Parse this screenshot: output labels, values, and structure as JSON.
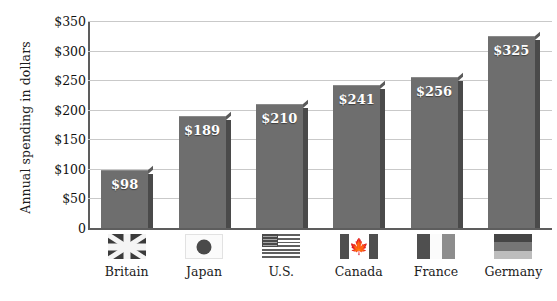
{
  "chart_data": {
    "type": "bar",
    "title": "",
    "xlabel": "",
    "ylabel": "Annual spending in dollars",
    "categories": [
      "Britain",
      "Japan",
      "U.S.",
      "Canada",
      "France",
      "Germany"
    ],
    "values": [
      98,
      189,
      210,
      241,
      256,
      325
    ],
    "value_labels": [
      "$98",
      "$189",
      "$210",
      "$241",
      "$256",
      "$325"
    ],
    "ylim": [
      0,
      350
    ],
    "ytick_values": [
      0,
      50,
      100,
      150,
      200,
      250,
      300,
      350
    ],
    "ytick_labels": [
      "0",
      "$50",
      "$100",
      "$150",
      "$200",
      "$250",
      "$300",
      "$350"
    ],
    "grid": true,
    "legend": "none",
    "series": [
      {
        "name": "Annual spending",
        "values": [
          98,
          189,
          210,
          241,
          256,
          325
        ]
      }
    ],
    "category_icons": [
      "flag-britain-icon",
      "flag-japan-icon",
      "flag-us-icon",
      "flag-canada-icon",
      "flag-france-icon",
      "flag-germany-icon"
    ],
    "colors": {
      "bar_fill": "#6e6e6e",
      "bar_shadow": "#4a4a4a",
      "gridline": "#c9c9c9",
      "axis": "#5d5d5d",
      "value_label": "#ffffff",
      "text": "#1c1c1c",
      "background": "#ffffff"
    }
  }
}
